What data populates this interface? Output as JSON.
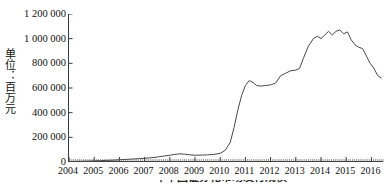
{
  "figure": {
    "ylabel": "单位：百万元",
    "caption_clipped": "年中国证券化市场发行规模"
  },
  "chart_data": {
    "type": "line",
    "title": "",
    "xlabel": "",
    "ylabel": "单位：百万元",
    "ylim": [
      0,
      1200000
    ],
    "xlim": [
      2004,
      2016.5
    ],
    "grid": false,
    "legend": null,
    "ytick_labels": [
      "1 200 000",
      "1 000 000",
      "800 000",
      "600 000",
      "400 000",
      "200 000",
      "0"
    ],
    "ytick_values": [
      1200000,
      1000000,
      800000,
      600000,
      400000,
      200000,
      0
    ],
    "xtick_labels": [
      "2004",
      "2005",
      "2006",
      "2007",
      "2008",
      "2009",
      "2010",
      "2011",
      "2012",
      "2013",
      "2014",
      "2015",
      "2016"
    ],
    "xtick_values": [
      2004,
      2005,
      2006,
      2007,
      2008,
      2009,
      2010,
      2011,
      2012,
      2013,
      2014,
      2015,
      2016
    ],
    "minor_ticks": "monthly",
    "series": [
      {
        "name": "发行规模",
        "color": "#4a4a4a",
        "x": [
          2004.0,
          2004.25,
          2004.5,
          2004.75,
          2005.0,
          2005.25,
          2005.5,
          2005.75,
          2006.0,
          2006.25,
          2006.5,
          2006.75,
          2007.0,
          2007.25,
          2007.5,
          2007.75,
          2008.0,
          2008.2,
          2008.4,
          2008.6,
          2008.8,
          2009.0,
          2009.25,
          2009.5,
          2009.75,
          2010.0,
          2010.2,
          2010.4,
          2010.55,
          2010.7,
          2010.85,
          2011.0,
          2011.15,
          2011.3,
          2011.45,
          2011.6,
          2011.8,
          2012.0,
          2012.2,
          2012.4,
          2012.6,
          2012.8,
          2013.0,
          2013.15,
          2013.3,
          2013.5,
          2013.7,
          2013.85,
          2014.0,
          2014.15,
          2014.3,
          2014.45,
          2014.6,
          2014.75,
          2014.9,
          2015.05,
          2015.2,
          2015.35,
          2015.5,
          2015.65,
          2015.8,
          2015.95,
          2016.1,
          2016.25,
          2016.4
        ],
        "values": [
          4000,
          5000,
          6000,
          7000,
          9000,
          11000,
          13000,
          15000,
          18000,
          21000,
          24000,
          27000,
          30000,
          34000,
          40000,
          48000,
          55000,
          62000,
          66000,
          63000,
          58000,
          55000,
          56000,
          58000,
          62000,
          70000,
          95000,
          160000,
          280000,
          420000,
          540000,
          620000,
          660000,
          645000,
          620000,
          615000,
          620000,
          625000,
          640000,
          700000,
          720000,
          740000,
          745000,
          760000,
          840000,
          940000,
          1000000,
          1020000,
          1000000,
          1030000,
          1060000,
          1030000,
          1060000,
          1070000,
          1040000,
          1055000,
          990000,
          950000,
          930000,
          920000,
          860000,
          800000,
          760000,
          700000,
          680000
        ]
      }
    ]
  }
}
